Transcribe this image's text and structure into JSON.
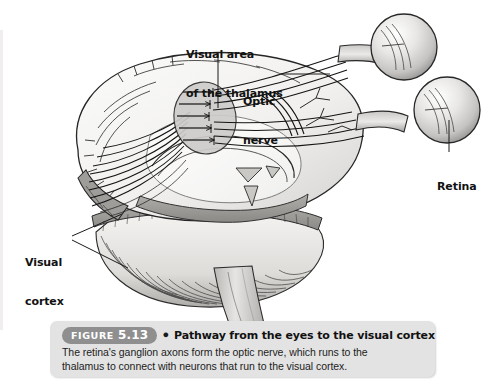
{
  "figure": {
    "badge_word": "FIGURE",
    "badge_number": "5.13",
    "bullet": "●",
    "title": "Pathway from the eyes to the visual cortex",
    "body_line1": "The retina's ganglion axons form the optic nerve, which runs to the",
    "body_line2": "thalamus to connect with neurons that run to the visual cortex."
  },
  "labels": {
    "thalamus_line1": "Visual area",
    "thalamus_line2": "of the thalamus",
    "optic_line1": "Optic",
    "optic_line2": "nerve",
    "retina": "Retina",
    "cortex_line1": "Visual",
    "cortex_line2": "cortex"
  },
  "colors": {
    "page_background": "#ffffff",
    "caption_panel": "#e3e3e3",
    "badge": "#8f8f8f",
    "badge_text": "#ffffff",
    "label_text": "#111111",
    "ink": "#1a1a1a",
    "brain_fill": "#f2f1ef",
    "brain_shade": "#bdbcba",
    "eye_fill": "#dddcda",
    "thalamus_fill": "#cfcecc"
  }
}
